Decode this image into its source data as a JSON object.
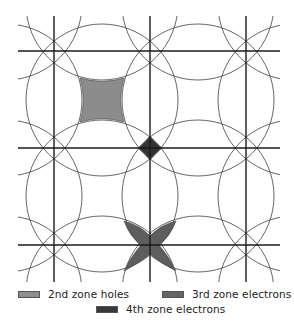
{
  "diagram": {
    "title": "",
    "grid": {
      "vertical_lines_x": [
        54,
        150,
        246
      ],
      "horizontal_lines_y": [
        51,
        148,
        245
      ],
      "extent": {
        "x_min": 18,
        "x_max": 280,
        "y_min": 16,
        "y_max": 282
      },
      "color": "#1a1a1a"
    },
    "circles": {
      "radius": 76,
      "centers_x": [
        6,
        102,
        198,
        294
      ],
      "centers_y": [
        4,
        100,
        196,
        292
      ],
      "color": "#555555"
    },
    "regions": [
      {
        "name": "2nd zone holes",
        "shape": "concave-square",
        "center": [
          102,
          100
        ],
        "color": "#8c8c8c"
      },
      {
        "name": "3rd zone electrons",
        "shape": "four-petal-star",
        "center": [
          150,
          245
        ],
        "color": "#5e5e5e"
      },
      {
        "name": "4th zone electrons",
        "shape": "diamond",
        "center": [
          150,
          148
        ],
        "color": "#333333"
      }
    ]
  },
  "legend": {
    "items": [
      {
        "label": "2nd zone holes",
        "color": "#8f8f8f"
      },
      {
        "label": "3rd zone electrons",
        "color": "#666666"
      },
      {
        "label": "4th zone electrons",
        "color": "#383838"
      }
    ]
  }
}
